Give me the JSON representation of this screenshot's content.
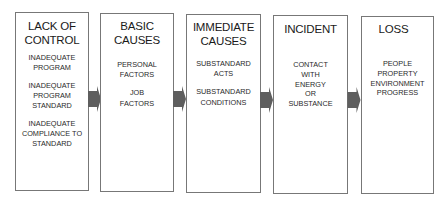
{
  "diagram": {
    "type": "flow",
    "direction": "left-to-right",
    "colors": {
      "box_border": "#777777",
      "arrow_fill": "#5e5e5e",
      "text": "#1e1e1e"
    },
    "boxes": [
      {
        "title": "LACK OF\nCONTROL",
        "items": [
          "INADEQUATE\nPROGRAM",
          "INADEQUATE\nPROGRAM\nSTANDARD",
          "INADEQUATE\nCOMPLIANCE TO\nSTANDARD"
        ]
      },
      {
        "title": "BASIC\nCAUSES",
        "items": [
          "PERSONAL\nFACTORS",
          "JOB\nFACTORS"
        ]
      },
      {
        "title": "IMMEDIATE\nCAUSES",
        "items": [
          "SUBSTANDARD\nACTS",
          "SUBSTANDARD\nCONDITIONS"
        ]
      },
      {
        "title": "INCIDENT",
        "items": [
          "CONTACT\nWITH\nENERGY\nOR\nSUBSTANCE"
        ]
      },
      {
        "title": "LOSS",
        "items": [
          "PEOPLE\nPROPERTY\nENVIRONMENT\nPROGRESS"
        ]
      }
    ],
    "connections": [
      {
        "from": "LACK OF CONTROL",
        "to": "BASIC CAUSES"
      },
      {
        "from": "BASIC CAUSES",
        "to": "IMMEDIATE CAUSES"
      },
      {
        "from": "IMMEDIATE CAUSES",
        "to": "INCIDENT"
      },
      {
        "from": "INCIDENT",
        "to": "LOSS"
      }
    ]
  }
}
